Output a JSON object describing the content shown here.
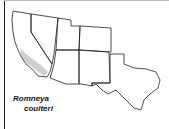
{
  "map": {
    "title": "Romneya coulteri",
    "species_label_line1": "Romneya",
    "species_label_line2": "coulteri",
    "region": "Southwestern United States",
    "states_shown": [
      "California",
      "Nevada",
      "Utah",
      "Colorado",
      "Arizona",
      "New Mexico",
      "Texas"
    ],
    "range_area": "Southern California coastal region",
    "colors": {
      "outline": "#222222",
      "range_fill": "#cfcfcf",
      "land_fill": "#ffffff",
      "background": "#ffffff"
    }
  }
}
